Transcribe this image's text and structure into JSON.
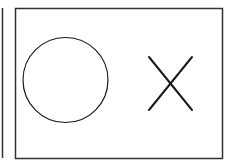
{
  "diagram": {
    "background": "#ffffff",
    "stroke_color": "#1a1a1a",
    "border_color": "#333333",
    "left_panel_edge": {
      "x": 2.5,
      "y1": 8,
      "y2": 158
    },
    "main_panel": {
      "x": 15.5,
      "y": 8.5,
      "width": 207,
      "height": 150
    },
    "shapes": [
      {
        "type": "circle",
        "label": "circle",
        "cx": 65.5,
        "cy": 80,
        "r": 42.5
      },
      {
        "type": "cross",
        "label": "x-mark",
        "x1": 149,
        "y1": 57,
        "x2": 192,
        "y2": 110
      }
    ]
  }
}
